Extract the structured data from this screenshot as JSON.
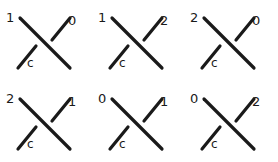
{
  "figure": {
    "background_color": "#ffffff",
    "stroke_color": "#1a1a1a",
    "rows": 2,
    "columns": 3
  },
  "panels": [
    {
      "id": "panel-1",
      "top_left": "1",
      "top_right": "0",
      "bottom_left": "c"
    },
    {
      "id": "panel-2",
      "top_left": "1",
      "top_right": "2",
      "bottom_left": "c"
    },
    {
      "id": "panel-3",
      "top_left": "2",
      "top_right": "0",
      "bottom_left": "c"
    },
    {
      "id": "panel-4",
      "top_left": "2",
      "top_right": "1",
      "bottom_left": "c"
    },
    {
      "id": "panel-5",
      "top_left": "0",
      "top_right": "1",
      "bottom_left": "c"
    },
    {
      "id": "panel-6",
      "top_left": "0",
      "top_right": "2",
      "bottom_left": "c"
    }
  ]
}
